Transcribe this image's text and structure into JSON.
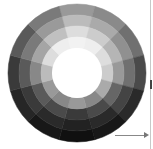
{
  "wheel": {
    "center": [
      77,
      73
    ],
    "ring_radii": [
      69,
      58,
      47,
      36,
      25
    ],
    "hole_color": "#ffffff",
    "sector_start_deg": -15,
    "sectors": [
      {
        "angle": 0,
        "rings": [
          "#999999",
          "#bbbbbb",
          "#dddddd",
          "#f2f2f2"
        ]
      },
      {
        "angle": 30,
        "rings": [
          "#8a8a8a",
          "#aaaaaa",
          "#cccccc",
          "#eeeeee"
        ]
      },
      {
        "angle": 60,
        "rings": [
          "#707070",
          "#909090",
          "#b5b5b5",
          "#dddddd"
        ]
      },
      {
        "angle": 90,
        "rings": [
          "#4a4a4a",
          "#707070",
          "#999999",
          "#cccccc"
        ]
      },
      {
        "angle": 120,
        "rings": [
          "#2a2a2a",
          "#444444",
          "#666666",
          "#aaaaaa"
        ]
      },
      {
        "angle": 150,
        "rings": [
          "#181818",
          "#2a2a2a",
          "#4a4a4a",
          "#888888"
        ]
      },
      {
        "angle": 180,
        "rings": [
          "#101010",
          "#222222",
          "#3a3a3a",
          "#999999"
        ]
      },
      {
        "angle": 210,
        "rings": [
          "#181818",
          "#2a2a2a",
          "#4a4a4a",
          "#888888"
        ]
      },
      {
        "angle": 240,
        "rings": [
          "#262626",
          "#3a3a3a",
          "#5a5a5a",
          "#999999"
        ]
      },
      {
        "angle": 270,
        "rings": [
          "#3a3a3a",
          "#5a5a5a",
          "#888888",
          "#bbbbbb"
        ]
      },
      {
        "angle": 300,
        "rings": [
          "#5a5a5a",
          "#7a7a7a",
          "#a5a5a5",
          "#dddddd"
        ]
      },
      {
        "angle": 330,
        "rings": [
          "#7a7a7a",
          "#9a9a9a",
          "#c0c0c0",
          "#eeeeee"
        ]
      }
    ]
  },
  "edge": {
    "line_color": "#c8c8c8",
    "tick_color": "#444444",
    "arrow_color": "#888888"
  }
}
